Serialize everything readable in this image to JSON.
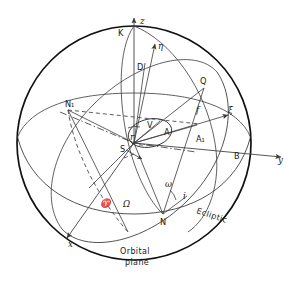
{
  "figure": {
    "background_color": "#ffffff",
    "line_color": "#333333",
    "outline_color": "#111111",
    "width": 289,
    "height": 289
  },
  "axes": [
    {
      "key": "z",
      "label": "z",
      "description": "vertical ecliptic pole axis, arrow up"
    },
    {
      "key": "y",
      "label": "y",
      "description": "horizontal axis to the right"
    },
    {
      "key": "x",
      "label": "x",
      "description": "axis toward lower left, out of page"
    }
  ],
  "vectors": [
    {
      "key": "eta",
      "label": "η",
      "description": "orbital frame unit vector eta"
    },
    {
      "key": "xi",
      "label": "ξ",
      "description": "orbital frame unit vector xi toward perihelion"
    }
  ],
  "points": [
    {
      "key": "S",
      "label": "S",
      "description": "Sun at centre of sphere"
    },
    {
      "key": "K",
      "label": "K",
      "description": "pole of the ecliptic"
    },
    {
      "key": "N",
      "label": "N",
      "description": "ascending node"
    },
    {
      "key": "N1",
      "label": "N₁",
      "description": "descending node"
    },
    {
      "key": "A",
      "label": "A",
      "description": "body position on orbit"
    },
    {
      "key": "A1",
      "label": "A₁",
      "description": "projection of A on ecliptic"
    },
    {
      "key": "B",
      "label": "B",
      "description": "point where y axis meets the sphere"
    },
    {
      "key": "D",
      "label": "D",
      "description": "pole of the orbital plane direction point"
    },
    {
      "key": "Q",
      "label": "Q",
      "description": "point on great circle through A"
    },
    {
      "key": "V",
      "label": "V",
      "description": "perihelion direction point"
    }
  ],
  "angles": [
    {
      "key": "Omega",
      "label": "Ω",
      "description": "longitude of the ascending node"
    },
    {
      "key": "omega",
      "label": "ω",
      "description": "argument of perihelion"
    },
    {
      "key": "i",
      "label": "i",
      "description": "inclination of the orbital plane to the ecliptic"
    },
    {
      "key": "f",
      "label": "f",
      "description": "true anomaly arc"
    },
    {
      "key": "r",
      "label": "r",
      "description": "radius vector from S to the body"
    }
  ],
  "symbols": [
    {
      "key": "aries",
      "label": "♈",
      "description": "vernal equinox / first point of Aries"
    }
  ],
  "plane_labels": [
    {
      "key": "ecliptic",
      "label": "Ecliptic",
      "description": "label along the ecliptic great circle"
    },
    {
      "key": "orbital_plane_line1",
      "label": "Orbital",
      "description": "first line of orbital plane label"
    },
    {
      "key": "orbital_plane_line2",
      "label": "plane",
      "description": "second line of orbital plane label"
    }
  ]
}
